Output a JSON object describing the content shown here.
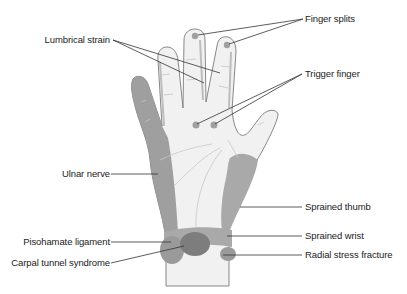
{
  "figure": {
    "colors": {
      "skin": "#f1f1f1",
      "outline": "#7a7a7a",
      "region_light": "#a9a9a9",
      "region_mid": "#9a9a9a",
      "region_dark": "#7d7d7d",
      "leader_line": "#333333",
      "text": "#222222"
    }
  },
  "labels": {
    "lumbrical_strain": "Lumbrical strain",
    "finger_splits": "Finger splits",
    "trigger_finger": "Trigger finger",
    "ulnar_nerve": "Ulnar nerve",
    "sprained_thumb": "Sprained thumb",
    "pisohamate_ligament": "Pisohamate ligament",
    "sprained_wrist": "Sprained wrist",
    "carpal_tunnel_syndrome": "Carpal tunnel syndrome",
    "radial_stress_fracture": "Radial stress fracture"
  }
}
